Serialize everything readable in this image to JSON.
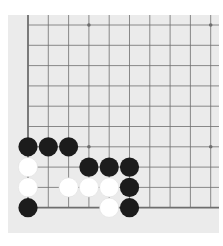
{
  "board": {
    "game": "Go",
    "visible_columns": 10,
    "visible_rows": 10,
    "edges": [
      "left",
      "bottom"
    ],
    "colors": {
      "background": "#ebebeb",
      "line": "#6e6e6e",
      "black_stone": "#1c1c1c",
      "white_stone": "#ffffff"
    },
    "star_points": [
      {
        "col": 3,
        "row": 0
      },
      {
        "col": 9,
        "row": 0
      },
      {
        "col": 3,
        "row": 6
      },
      {
        "col": 9,
        "row": 6
      }
    ],
    "stones": [
      {
        "color": "black",
        "col": 0,
        "row": 6
      },
      {
        "color": "black",
        "col": 1,
        "row": 6
      },
      {
        "color": "black",
        "col": 2,
        "row": 6
      },
      {
        "color": "white",
        "col": 0,
        "row": 7
      },
      {
        "color": "black",
        "col": 3,
        "row": 7
      },
      {
        "color": "black",
        "col": 4,
        "row": 7
      },
      {
        "color": "black",
        "col": 5,
        "row": 7
      },
      {
        "color": "white",
        "col": 0,
        "row": 8
      },
      {
        "color": "white",
        "col": 2,
        "row": 8
      },
      {
        "color": "white",
        "col": 3,
        "row": 8
      },
      {
        "color": "white",
        "col": 4,
        "row": 8
      },
      {
        "color": "black",
        "col": 5,
        "row": 8
      },
      {
        "color": "black",
        "col": 0,
        "row": 9
      },
      {
        "color": "white",
        "col": 4,
        "row": 9
      },
      {
        "color": "black",
        "col": 5,
        "row": 9
      }
    ]
  }
}
